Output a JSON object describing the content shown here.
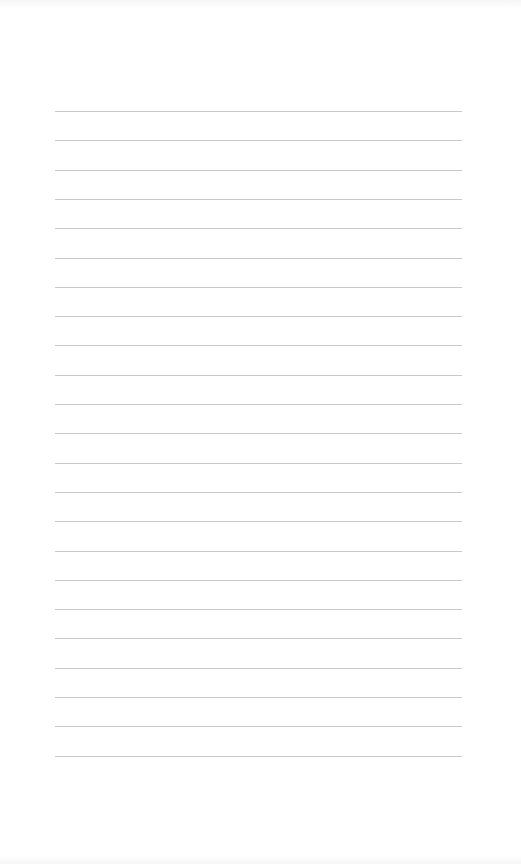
{
  "document": {
    "type": "lined-paper",
    "background_color": "#ffffff",
    "line_color": "#c9c9c9",
    "line_count": 23,
    "first_line_y": 111,
    "line_spacing": 29.3,
    "line_left": 55,
    "line_right": 462
  }
}
